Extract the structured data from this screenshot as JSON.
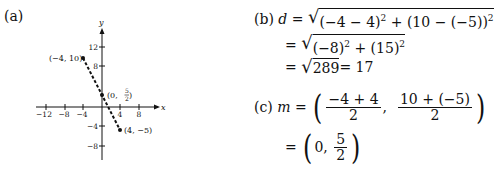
{
  "part_a": {
    "label": "(a)",
    "axes": {
      "x_label": "x",
      "y_label": "y",
      "x_ticks": [
        "−12",
        "−8",
        "−4",
        "4",
        "8"
      ],
      "y_ticks": [
        "12",
        "8",
        "−4",
        "−8"
      ]
    },
    "points": [
      {
        "label": "(−4, 10)",
        "x": -4,
        "y": 10
      },
      {
        "label": "(4, −5)",
        "x": 4,
        "y": -5
      }
    ],
    "midpoint": {
      "label_prefix": "(0, ",
      "num": "5",
      "den": "2",
      "label_suffix": ")",
      "x": 0,
      "y": 2.5
    }
  },
  "part_b": {
    "label": "(b)",
    "var": "d",
    "line1": "(−4 − 4)",
    "line1b": " + (10 − (−5))",
    "line2": "(−8)",
    "line2b": " + (15)",
    "line3_radicand": "289",
    "line3_result": " = 17",
    "eq": "=",
    "exp": "2"
  },
  "part_c": {
    "label": "(c)",
    "var": "m",
    "eq": "=",
    "frac1_num": "−4 + 4",
    "frac1_den": "2",
    "frac2_num": "10 + (−5)",
    "frac2_den": "2",
    "result_first": "0,",
    "result_num": "5",
    "result_den": "2"
  }
}
